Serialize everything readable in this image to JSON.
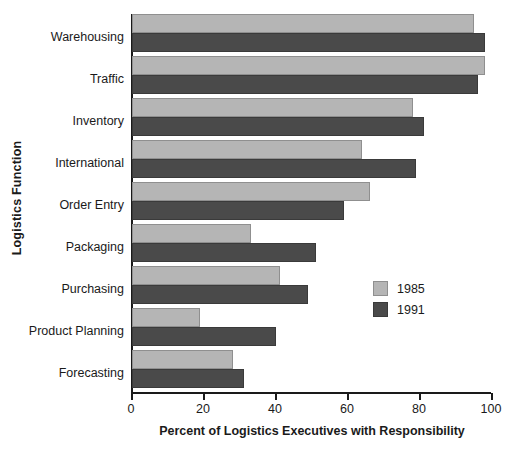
{
  "chart_data": {
    "type": "bar",
    "orientation": "horizontal",
    "title": "",
    "xlabel": "Percent of Logistics Executives with Responsibility",
    "ylabel": "Logistics Function",
    "xlim": [
      0,
      100
    ],
    "xticks": [
      0,
      20,
      40,
      60,
      80,
      100
    ],
    "grid": false,
    "legend_position": "center-right",
    "categories": [
      "Warehousing",
      "Traffic",
      "Inventory",
      "International",
      "Order Entry",
      "Packaging",
      "Purchasing",
      "Product Planning",
      "Forecasting"
    ],
    "series": [
      {
        "name": "1985",
        "color": "#b5b5b5",
        "values": [
          95,
          98,
          78,
          64,
          66,
          33,
          41,
          19,
          28
        ]
      },
      {
        "name": "1991",
        "color": "#4a4a4a",
        "values": [
          98,
          96,
          81,
          79,
          59,
          51,
          49,
          40,
          31
        ]
      }
    ]
  },
  "legend": {
    "items": [
      {
        "label": "1985",
        "swatch": "y1985"
      },
      {
        "label": "1991",
        "swatch": "y1991"
      }
    ]
  },
  "colors": {
    "series_1985": "#b5b5b5",
    "series_1991": "#4a4a4a",
    "axis": "#1a1a1a",
    "background": "#ffffff"
  }
}
